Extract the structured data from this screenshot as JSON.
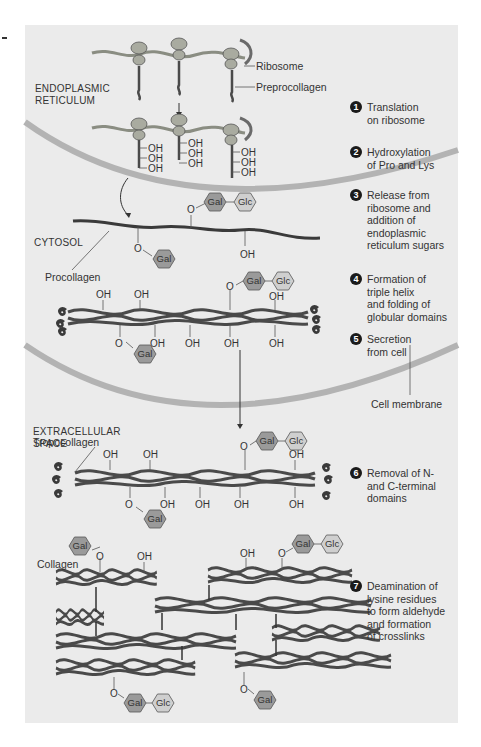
{
  "figure": {
    "regions": {
      "er": [
        "ENDOPLASMIC",
        "RETICULUM"
      ],
      "cytosol": "CYTOSOL",
      "extracellular": [
        "EXTRACELLULAR",
        "SPACE"
      ]
    },
    "callouts": {
      "ribosome": "Ribosome",
      "preprocollagen": "Preprocollagen",
      "procollagen": "Procollagen",
      "cell_membrane": "Cell membrane",
      "tropocollagen": "Tropocollagen",
      "collagen": "Collagen"
    },
    "groups": {
      "oh": "OH",
      "o": "O",
      "gal": "Gal",
      "glc": "Glc"
    },
    "steps": [
      {
        "num": "1",
        "text": "Translation\non ribosome"
      },
      {
        "num": "2",
        "text": "Hydroxylation\nof Pro and Lys"
      },
      {
        "num": "3",
        "text": "Release from\nribosome and\naddition of\nendoplasmic\nreticulum sugars"
      },
      {
        "num": "4",
        "text": "Formation of\ntriple helix\nand folding of\nglobular domains"
      },
      {
        "num": "5",
        "text": "Secretion\nfrom cell"
      },
      {
        "num": "6",
        "text": "Removal of N-\nand C-terminal\ndomains"
      },
      {
        "num": "7",
        "text": "Deamination of\nlysine residues\nto form aldehyde\nand formation\nof crosslinks"
      }
    ],
    "colors": {
      "panel_bg": "#ebebeb",
      "membrane": "#b3b3b3",
      "strand": "#4a4a4a",
      "ribosome": "#a9aba0",
      "gal_fill": "#9a9a9a",
      "glc_fill": "#cfcfcf",
      "step_badge": "#1a1a1a"
    }
  }
}
